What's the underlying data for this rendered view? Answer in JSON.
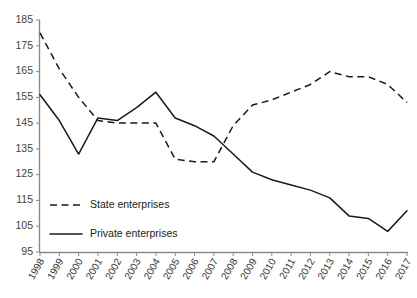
{
  "chart_data": {
    "type": "line",
    "title": "",
    "subtitle": "",
    "xlabel": "",
    "ylabel": "",
    "grid": false,
    "legend_position": "inside-bottom-left",
    "categories": [
      "1998",
      "1999",
      "2000",
      "2001",
      "2002",
      "2003",
      "2004",
      "2005",
      "2006",
      "2007",
      "2008",
      "2009",
      "2010",
      "2011",
      "2012",
      "2013",
      "2014",
      "2015",
      "2016",
      "2017"
    ],
    "x": [
      1998,
      1999,
      2000,
      2001,
      2002,
      2003,
      2004,
      2005,
      2006,
      2007,
      2008,
      2009,
      2010,
      2011,
      2012,
      2013,
      2014,
      2015,
      2016,
      2017
    ],
    "xlim": [
      1998,
      2017
    ],
    "ylim": [
      95,
      185
    ],
    "yticks": [
      95,
      105,
      115,
      125,
      135,
      145,
      155,
      165,
      175,
      185
    ],
    "xticks": [
      "1998",
      "1999",
      "2000",
      "2001",
      "2002",
      "2003",
      "2004",
      "2005",
      "2006",
      "2007",
      "2008",
      "2009",
      "2010",
      "2011",
      "2012",
      "2013",
      "2014",
      "2015",
      "2016",
      "2017"
    ],
    "series": [
      {
        "name": "State enterprises",
        "style": "dashed",
        "color": "#1a1a1a",
        "values": [
          180,
          166,
          155,
          146,
          145,
          145,
          145,
          131,
          130,
          130,
          144,
          152,
          154,
          157,
          160,
          165,
          163,
          163,
          160,
          153
        ]
      },
      {
        "name": "Private enterprises",
        "style": "solid",
        "color": "#1a1a1a",
        "values": [
          156,
          146,
          133,
          147,
          146,
          151,
          157,
          147,
          144,
          140,
          133,
          126,
          123,
          121,
          119,
          116,
          109,
          108,
          103,
          111
        ]
      }
    ]
  },
  "legend": {
    "items": [
      {
        "label": "State enterprises",
        "style": "dashed"
      },
      {
        "label": "Private enterprises",
        "style": "solid"
      }
    ]
  },
  "axes": {
    "y_tick_labels": [
      "185",
      "175",
      "165",
      "155",
      "145",
      "135",
      "125",
      "115",
      "105",
      "95"
    ],
    "x_tick_labels": [
      "1998",
      "1999",
      "2000",
      "2001",
      "2002",
      "2003",
      "2004",
      "2005",
      "2006",
      "2007",
      "2008",
      "2009",
      "2010",
      "2011",
      "2012",
      "2013",
      "2014",
      "2015",
      "2016",
      "2017"
    ]
  },
  "colors": {
    "line": "#1a1a1a",
    "axis": "#8a8a8a",
    "text": "#333333",
    "background": "#ffffff"
  }
}
